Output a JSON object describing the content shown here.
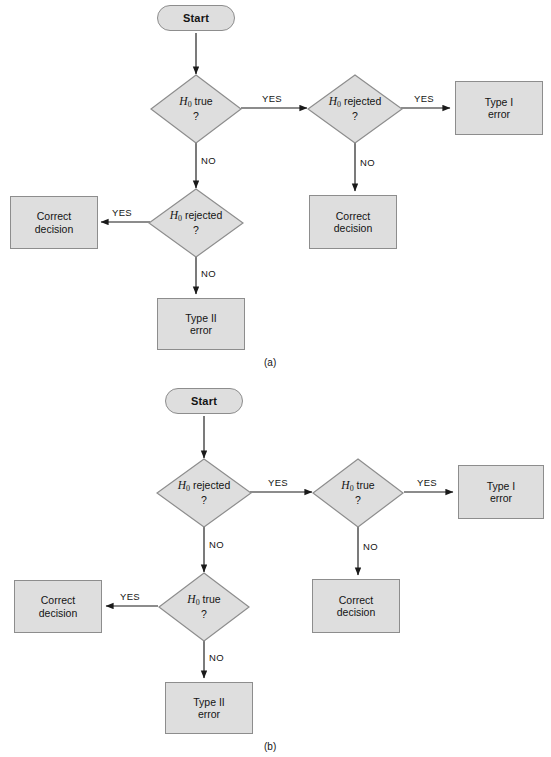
{
  "figure": {
    "type": "flowchart",
    "clipped_header_text": "",
    "colors": {
      "node_fill": "#dedede",
      "node_stroke": "#8d8d8d",
      "connector": "#1a1a1a",
      "text": "#141414",
      "background": "#ffffff"
    }
  },
  "panels": [
    {
      "id": "a",
      "caption": "(a)",
      "nodes": {
        "start": {
          "label": "Start",
          "shape": "terminator"
        },
        "decision_1": {
          "h": "H",
          "sub": "0",
          "text": "true",
          "q": "?",
          "shape": "diamond"
        },
        "decision_2": {
          "h": "H",
          "sub": "0",
          "text": "rejected",
          "q": "?",
          "shape": "diamond"
        },
        "decision_3": {
          "h": "H",
          "sub": "0",
          "text": "rejected",
          "q": "?",
          "shape": "diamond"
        },
        "type_1_error": {
          "line1": "Type I",
          "line2": "error",
          "shape": "box"
        },
        "correct_decision_right": {
          "line1": "Correct",
          "line2": "decision",
          "shape": "box"
        },
        "correct_decision_left": {
          "line1": "Correct",
          "line2": "decision",
          "shape": "box"
        },
        "type_2_error": {
          "line1": "Type II",
          "line2": "error",
          "shape": "box"
        }
      },
      "edges": [
        {
          "from": "start",
          "to": "decision_1",
          "label": ""
        },
        {
          "from": "decision_1",
          "to": "decision_2",
          "label": "YES"
        },
        {
          "from": "decision_1",
          "to": "decision_3",
          "label": "NO"
        },
        {
          "from": "decision_2",
          "to": "type_1_error",
          "label": "YES"
        },
        {
          "from": "decision_2",
          "to": "correct_decision_right",
          "label": "NO"
        },
        {
          "from": "decision_3",
          "to": "correct_decision_left",
          "label": "YES"
        },
        {
          "from": "decision_3",
          "to": "type_2_error",
          "label": "NO"
        }
      ]
    },
    {
      "id": "b",
      "caption": "(b)",
      "nodes": {
        "start": {
          "label": "Start",
          "shape": "terminator"
        },
        "decision_1": {
          "h": "H",
          "sub": "0",
          "text": "rejected",
          "q": "?",
          "shape": "diamond"
        },
        "decision_2": {
          "h": "H",
          "sub": "0",
          "text": "true",
          "q": "?",
          "shape": "diamond"
        },
        "decision_3": {
          "h": "H",
          "sub": "0",
          "text": "true",
          "q": "?",
          "shape": "diamond"
        },
        "type_1_error": {
          "line1": "Type I",
          "line2": "error",
          "shape": "box"
        },
        "correct_decision_right": {
          "line1": "Correct",
          "line2": "decision",
          "shape": "box"
        },
        "correct_decision_left": {
          "line1": "Correct",
          "line2": "decision",
          "shape": "box"
        },
        "type_2_error": {
          "line1": "Type II",
          "line2": "error",
          "shape": "box"
        }
      },
      "edges": [
        {
          "from": "start",
          "to": "decision_1",
          "label": ""
        },
        {
          "from": "decision_1",
          "to": "decision_2",
          "label": "YES"
        },
        {
          "from": "decision_1",
          "to": "decision_3",
          "label": "NO"
        },
        {
          "from": "decision_2",
          "to": "type_1_error",
          "label": "YES"
        },
        {
          "from": "decision_2",
          "to": "correct_decision_right",
          "label": "NO"
        },
        {
          "from": "decision_3",
          "to": "correct_decision_left",
          "label": "YES"
        },
        {
          "from": "decision_3",
          "to": "type_2_error",
          "label": "NO"
        }
      ]
    }
  ],
  "edge_labels": {
    "yes": "YES",
    "no": "NO"
  }
}
